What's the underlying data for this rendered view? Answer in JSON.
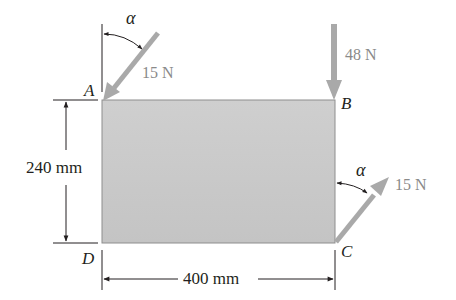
{
  "diagram": {
    "title": "",
    "plate": {
      "fill": "#c8c8c8",
      "edge": "#8e8e8e",
      "width_label": "400 mm",
      "height_label": "240 mm"
    },
    "points": {
      "A": "A",
      "B": "B",
      "C": "C",
      "D": "D"
    },
    "forces": [
      {
        "id": "force-A",
        "magnitude": "15 N",
        "at": "A",
        "direction": "down-left at angle alpha from vertical"
      },
      {
        "id": "force-B",
        "magnitude": "48 N",
        "at": "B",
        "direction": "vertical downward"
      },
      {
        "id": "force-C",
        "magnitude": "15 N",
        "at": "C",
        "direction": "up-right at angle alpha from vertical"
      }
    ],
    "angles": {
      "A": "α",
      "C": "α"
    },
    "colors": {
      "arrow": "#a9a9a9",
      "line": "#231f20",
      "force_text": "#8a8a8a"
    }
  }
}
